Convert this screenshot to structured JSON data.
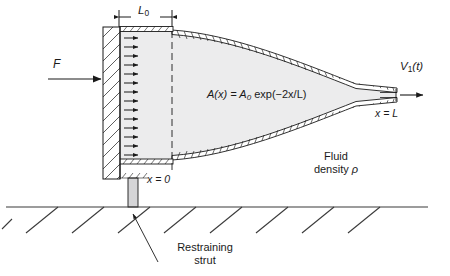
{
  "figure": {
    "type": "engineering-diagram",
    "labels": {
      "force": "F",
      "chamber_length": "L",
      "chamber_length_sub": "0",
      "area_equation": "A(x) = A",
      "area_equation_sub": "0",
      "area_equation_tail": " exp(−2x/L)",
      "exit_velocity": "V",
      "exit_velocity_sub": "1",
      "exit_velocity_tail": "(t)",
      "station_exit": "x = L",
      "station_inlet": "x = 0",
      "fluid_line1": "Fluid",
      "fluid_line2": "density ",
      "fluid_rho": "ρ",
      "strut_line1": "Restraining",
      "strut_line2": "strut"
    },
    "colors": {
      "stroke": "#1a1a1a",
      "fluid_fill": "#ececed",
      "wall_fill": "#ffffff",
      "strut_fill": "#d5d5d7",
      "ground": "#3a3a3a"
    },
    "geometry": {
      "axis_y": 95,
      "chamber_left": 103,
      "chamber_right": 172,
      "exit_x": 398,
      "ground_y": 207,
      "arrow_count": 15
    }
  }
}
